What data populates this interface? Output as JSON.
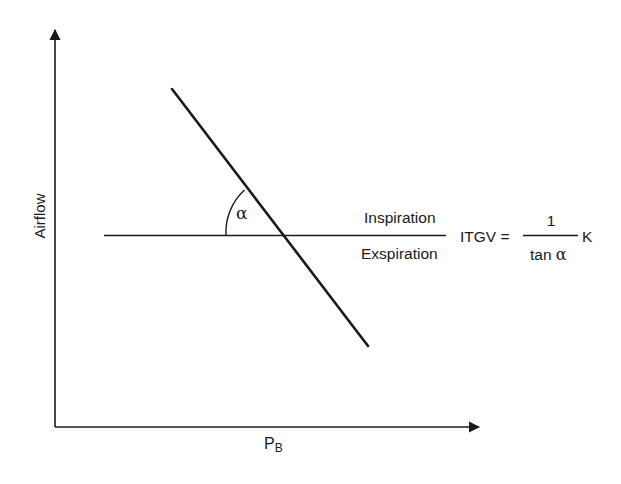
{
  "diagram": {
    "axes": {
      "y_label": "Airflow",
      "x_label_main": "P",
      "x_label_sub": "B"
    },
    "angle_label": "α",
    "zero_line": {
      "upper_label": "Inspiration",
      "lower_label": "Exspiration"
    },
    "formula": {
      "lhs": "ITGV =",
      "numerator": "1",
      "denominator_text": "tan ",
      "denominator_greek": "α",
      "factor": "K"
    },
    "colors": {
      "line": "#1a1a1a",
      "background": "#ffffff"
    }
  }
}
